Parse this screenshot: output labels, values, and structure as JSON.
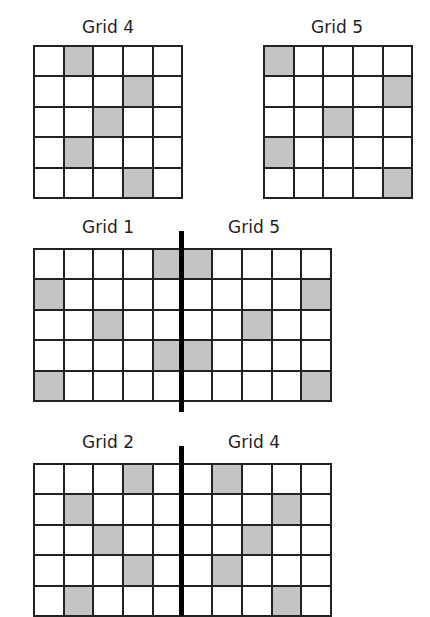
{
  "colors": {
    "shaded": "#c4c4c4",
    "line": "#222222",
    "background": "#ffffff"
  },
  "top_left": {
    "label": "Grid 4",
    "rows": 5,
    "cols": 5,
    "shaded": [
      [
        0,
        1
      ],
      [
        1,
        3
      ],
      [
        2,
        2
      ],
      [
        3,
        1
      ],
      [
        4,
        3
      ]
    ]
  },
  "top_right": {
    "label": "Grid 5",
    "rows": 5,
    "cols": 5,
    "shaded": [
      [
        0,
        0
      ],
      [
        1,
        4
      ],
      [
        2,
        2
      ],
      [
        3,
        0
      ],
      [
        4,
        4
      ]
    ]
  },
  "middle": {
    "left_label": "Grid 1",
    "right_label": "Grid 5",
    "rows": 5,
    "cols": 10,
    "shaded": [
      [
        0,
        4
      ],
      [
        1,
        0
      ],
      [
        2,
        2
      ],
      [
        3,
        4
      ],
      [
        4,
        0
      ],
      [
        0,
        5
      ],
      [
        1,
        9
      ],
      [
        2,
        7
      ],
      [
        3,
        5
      ],
      [
        4,
        9
      ]
    ]
  },
  "bottom": {
    "left_label": "Grid 2",
    "right_label": "Grid 4",
    "rows": 5,
    "cols": 10,
    "shaded": [
      [
        0,
        3
      ],
      [
        1,
        1
      ],
      [
        2,
        2
      ],
      [
        3,
        3
      ],
      [
        4,
        1
      ],
      [
        0,
        6
      ],
      [
        1,
        8
      ],
      [
        2,
        7
      ],
      [
        3,
        6
      ],
      [
        4,
        8
      ]
    ]
  }
}
